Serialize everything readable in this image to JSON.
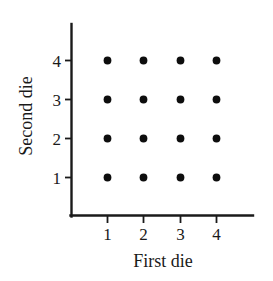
{
  "chart_data": {
    "type": "scatter",
    "title": "",
    "xlabel": "First die",
    "ylabel": "Second die",
    "xticks": [
      "1",
      "2",
      "3",
      "4"
    ],
    "yticks": [
      "1",
      "2",
      "3",
      "4"
    ],
    "x": [
      1,
      2,
      3,
      4,
      1,
      2,
      3,
      4,
      1,
      2,
      3,
      4,
      1,
      2,
      3,
      4
    ],
    "y": [
      1,
      1,
      1,
      1,
      2,
      2,
      2,
      2,
      3,
      3,
      3,
      3,
      4,
      4,
      4,
      4
    ],
    "points": [
      {
        "x": 1,
        "y": 1
      },
      {
        "x": 2,
        "y": 1
      },
      {
        "x": 3,
        "y": 1
      },
      {
        "x": 4,
        "y": 1
      },
      {
        "x": 1,
        "y": 2
      },
      {
        "x": 2,
        "y": 2
      },
      {
        "x": 3,
        "y": 2
      },
      {
        "x": 4,
        "y": 2
      },
      {
        "x": 1,
        "y": 3
      },
      {
        "x": 2,
        "y": 3
      },
      {
        "x": 3,
        "y": 3
      },
      {
        "x": 4,
        "y": 3
      },
      {
        "x": 1,
        "y": 4
      },
      {
        "x": 2,
        "y": 4
      },
      {
        "x": 3,
        "y": 4
      },
      {
        "x": 4,
        "y": 4
      }
    ],
    "xlim": [
      0.45,
      5.1
    ],
    "ylim": [
      0.35,
      5.0
    ],
    "grid": false,
    "legend": null,
    "marker_color": "#0d0d0d",
    "axis_color": "#1a1a1a",
    "background_color": "#ffffff",
    "point_count": 16
  }
}
